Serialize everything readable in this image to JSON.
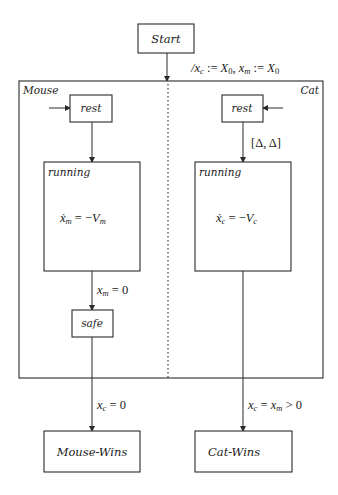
{
  "diagram": {
    "type": "statechart",
    "start": {
      "label": "Start"
    },
    "init_transition": {
      "label": "/x_c := X_0, x_m := X_0",
      "parts": {
        "slash": "/",
        "xc": "x",
        "c": "c",
        "assign1": " := ",
        "X1": "X",
        "zero1": "0",
        "comma": ", ",
        "xm": "x",
        "m": "m",
        "assign2": " := ",
        "X2": "X",
        "zero2": "0"
      }
    },
    "parallel_state": {
      "mouse": {
        "label": "Mouse",
        "rest": {
          "label": "rest"
        },
        "running": {
          "label": "running",
          "flow": {
            "x": "ẋ",
            "sub": "m",
            "eq": " = −",
            "V": "V",
            "vsub": "m"
          }
        },
        "guard_to_safe": {
          "x": "x",
          "sub": "m",
          "rest": " = 0"
        },
        "safe": {
          "label": "safe"
        }
      },
      "cat": {
        "label": "Cat",
        "rest": {
          "label": "rest"
        },
        "delay_guard": {
          "label": "[Δ, Δ]"
        },
        "running": {
          "label": "running",
          "flow": {
            "x": "ẋ",
            "sub": "c",
            "eq": " = −",
            "V": "V",
            "vsub": "c"
          }
        }
      }
    },
    "exit_transitions": {
      "mouse_wins_guard": {
        "x": "x",
        "sub": "c",
        "rest": " = 0"
      },
      "cat_wins_guard": {
        "x1": "x",
        "sub1": "c",
        "eq": " = ",
        "x2": "x",
        "sub2": "m",
        "rest": " > 0"
      }
    },
    "final_states": {
      "mouse_wins": {
        "label": "Mouse-Wins"
      },
      "cat_wins": {
        "label": "Cat-Wins"
      }
    }
  }
}
